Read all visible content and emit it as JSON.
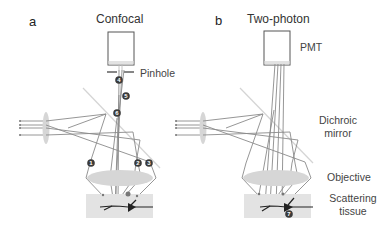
{
  "panels": [
    {
      "letter": "a",
      "title": "Confocal",
      "pinhole_label": "Pinhole",
      "badges": [
        "1",
        "2",
        "3",
        "4",
        "5",
        "6"
      ]
    },
    {
      "letter": "b",
      "title": "Two-photon",
      "pmt_label": "PMT",
      "dichroic_label_line1": "Dichroic",
      "dichroic_label_line2": "mirror",
      "objective_label": "Objective",
      "tissue_label_line1": "Scattering",
      "tissue_label_line2": "tissue",
      "badges": [
        "7"
      ]
    }
  ],
  "colors": {
    "ray": "#8a8a8a",
    "badge": "#3a3a3a",
    "lens": "#d6d6d6",
    "tissue": "#e3e3e3",
    "neuron": "#222222"
  }
}
